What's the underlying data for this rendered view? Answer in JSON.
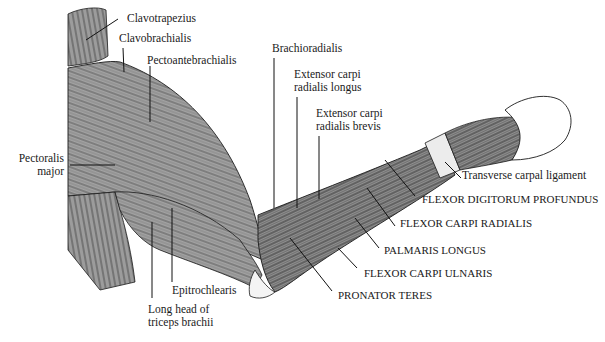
{
  "diagram": {
    "colors": {
      "muscle_fill": "#9a9a9a",
      "line": "#1a1a1a",
      "background": "#ffffff",
      "tendon": "#e8e8e8"
    }
  },
  "labels": {
    "clavotrapezius": "Clavotrapezius",
    "clavobrachialis": "Clavobrachialis",
    "pectoantebrachialis": "Pectoantebrachialis",
    "pectoralis_major_1": "Pectoralis",
    "pectoralis_major_2": "major",
    "brachioradialis": "Brachioradialis",
    "ecrl_1": "Extensor carpi",
    "ecrl_2": "radialis longus",
    "ecrb_1": "Extensor carpi",
    "ecrb_2": "radialis brevis",
    "transverse_carpal": "Transverse carpal ligament",
    "fdp": "FLEXOR DIGITORUM PROFUNDUS",
    "fcr": "FLEXOR CARPI RADIALIS",
    "palmaris": "PALMARIS LONGUS",
    "fcu": "FLEXOR CARPI ULNARIS",
    "pronator": "PRONATOR TERES",
    "epitrochlearis": "Epitrochlearis",
    "triceps_1": "Long head of",
    "triceps_2": "triceps brachii"
  }
}
